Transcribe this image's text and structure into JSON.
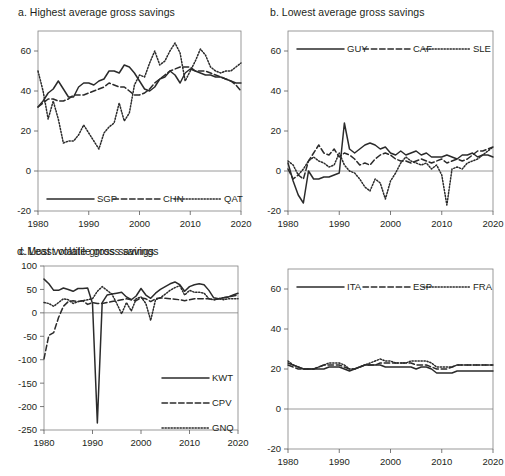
{
  "figure": {
    "background": "#ffffff",
    "line_color": "#2b2b2b",
    "axis_color": "#808080"
  },
  "panels": [
    {
      "id": "a",
      "title": "a. Highest average gross savings"
    },
    {
      "id": "b",
      "title": "b. Lowest average gross savings"
    },
    {
      "id": "c",
      "title": "c.Most volatile gross savings"
    },
    {
      "id": "d",
      "title": "d. Least volatile gross savings"
    }
  ],
  "chart_data": [
    {
      "panel": "a",
      "type": "line",
      "title": "a. Highest average gross savings",
      "xlabel": "",
      "ylabel": "",
      "xlim": [
        1980,
        2020
      ],
      "ylim": [
        -20,
        70
      ],
      "xticks": [
        1980,
        1990,
        2000,
        2010,
        2020
      ],
      "yticks": [
        -20,
        0,
        20,
        40,
        60
      ],
      "ytick_labels": [
        "-20",
        "0",
        "20",
        "40",
        "60"
      ],
      "grid": false,
      "legend_position": "bottom-inside",
      "x": [
        1980,
        1981,
        1982,
        1983,
        1984,
        1985,
        1986,
        1987,
        1988,
        1989,
        1990,
        1991,
        1992,
        1993,
        1994,
        1995,
        1996,
        1997,
        1998,
        1999,
        2000,
        2001,
        2002,
        2003,
        2004,
        2005,
        2006,
        2007,
        2008,
        2009,
        2010,
        2011,
        2012,
        2013,
        2014,
        2015,
        2016,
        2017,
        2018,
        2019,
        2020
      ],
      "series": [
        {
          "name": "SGP",
          "style": "solid",
          "values": [
            32,
            35,
            39,
            41,
            45,
            41,
            37,
            37,
            42,
            44,
            44,
            43,
            45,
            46,
            50,
            50,
            49,
            53,
            52,
            49,
            45,
            41,
            40,
            42,
            46,
            47,
            50,
            48,
            44,
            49,
            51,
            50,
            49,
            48,
            48,
            47,
            47,
            46,
            45,
            44,
            44
          ]
        },
        {
          "name": "CHN",
          "style": "dashed",
          "values": [
            32,
            34,
            36,
            36,
            35,
            35,
            36,
            38,
            38,
            38,
            39,
            40,
            41,
            42,
            44,
            43,
            42,
            42,
            40,
            38,
            38,
            39,
            41,
            44,
            46,
            48,
            50,
            51,
            52,
            52,
            52,
            50,
            50,
            50,
            49,
            48,
            47,
            46,
            45,
            43,
            40
          ]
        },
        {
          "name": "QAT",
          "style": "dotted",
          "values": [
            50,
            40,
            26,
            35,
            26,
            14,
            15,
            15,
            18,
            23,
            19,
            15,
            11,
            19,
            22,
            24,
            34,
            25,
            29,
            43,
            48,
            47,
            54,
            60,
            53,
            55,
            60,
            64,
            59,
            45,
            50,
            55,
            61,
            58,
            52,
            50,
            49,
            50,
            50,
            52,
            54
          ]
        }
      ]
    },
    {
      "panel": "b",
      "type": "line",
      "title": "b. Lowest average gross savings",
      "xlabel": "",
      "ylabel": "",
      "xlim": [
        1980,
        2020
      ],
      "ylim": [
        -20,
        70
      ],
      "xticks": [
        1980,
        1990,
        2000,
        2010,
        2020
      ],
      "yticks": [
        -20,
        0,
        20,
        40,
        60
      ],
      "ytick_labels": [
        "-20",
        "0",
        "20",
        "40",
        "60"
      ],
      "grid": false,
      "legend_position": "top-inside",
      "x": [
        1980,
        1981,
        1982,
        1983,
        1984,
        1985,
        1986,
        1987,
        1988,
        1989,
        1990,
        1991,
        1992,
        1993,
        1994,
        1995,
        1996,
        1997,
        1998,
        1999,
        2000,
        2001,
        2002,
        2003,
        2004,
        2005,
        2006,
        2007,
        2008,
        2009,
        2010,
        2011,
        2012,
        2013,
        2014,
        2015,
        2016,
        2017,
        2018,
        2019,
        2020
      ],
      "series": [
        {
          "name": "GUY",
          "style": "solid",
          "values": [
            4,
            -5,
            -12,
            -16,
            0,
            -4,
            -4,
            -3,
            -3,
            -2,
            -1,
            24,
            11,
            9,
            11,
            13,
            14,
            13,
            11,
            12,
            9,
            8,
            10,
            8,
            9,
            10,
            8,
            9,
            7,
            7,
            7,
            8,
            7,
            6,
            8,
            8,
            9,
            7,
            8,
            8,
            7
          ]
        },
        {
          "name": "CAF",
          "style": "dashed",
          "values": [
            1,
            -4,
            -2,
            -4,
            5,
            9,
            13,
            9,
            8,
            11,
            7,
            9,
            8,
            6,
            3,
            4,
            3,
            6,
            8,
            9,
            8,
            6,
            5,
            5,
            4,
            5,
            6,
            5,
            4,
            5,
            6,
            4,
            5,
            6,
            5,
            6,
            8,
            10,
            10,
            11,
            12
          ]
        },
        {
          "name": "SLE",
          "style": "dotted",
          "values": [
            5,
            3,
            -2,
            1,
            5,
            7,
            5,
            4,
            2,
            3,
            9,
            3,
            0,
            -1,
            -4,
            -8,
            -10,
            -4,
            -6,
            -14,
            -5,
            -1,
            4,
            7,
            5,
            4,
            3,
            4,
            1,
            3,
            -2,
            -17,
            1,
            2,
            1,
            4,
            5,
            6,
            8,
            10,
            12
          ]
        }
      ]
    },
    {
      "panel": "c",
      "type": "line",
      "title": "c.Most volatile gross savings",
      "xlabel": "",
      "ylabel": "",
      "xlim": [
        1980,
        2020
      ],
      "ylim": [
        -250,
        100
      ],
      "xticks": [
        1980,
        1990,
        2000,
        2010,
        2020
      ],
      "yticks": [
        -250,
        -200,
        -150,
        -100,
        -50,
        0,
        50,
        100
      ],
      "ytick_labels": [
        "-250",
        "-200",
        "-150",
        "-100",
        "-50",
        "0",
        "50",
        "100"
      ],
      "grid": false,
      "legend_position": "bottom-right-inside",
      "x": [
        1980,
        1981,
        1982,
        1983,
        1984,
        1985,
        1986,
        1987,
        1988,
        1989,
        1990,
        1991,
        1992,
        1993,
        1994,
        1995,
        1996,
        1997,
        1998,
        1999,
        2000,
        2001,
        2002,
        2003,
        2004,
        2005,
        2006,
        2007,
        2008,
        2009,
        2010,
        2011,
        2012,
        2013,
        2014,
        2015,
        2016,
        2017,
        2018,
        2019,
        2020
      ],
      "series": [
        {
          "name": "KWT",
          "style": "solid",
          "values": [
            72,
            62,
            48,
            48,
            53,
            50,
            46,
            52,
            52,
            53,
            20,
            -235,
            22,
            38,
            40,
            42,
            44,
            34,
            28,
            36,
            52,
            38,
            31,
            42,
            50,
            56,
            62,
            66,
            60,
            46,
            56,
            60,
            62,
            60,
            48,
            32,
            30,
            32,
            34,
            38,
            42
          ]
        },
        {
          "name": "CPV",
          "style": "dashed",
          "values": [
            -98,
            -48,
            -42,
            -10,
            14,
            24,
            26,
            24,
            26,
            18,
            22,
            20,
            20,
            22,
            24,
            26,
            28,
            30,
            28,
            26,
            32,
            30,
            24,
            30,
            32,
            31,
            30,
            29,
            28,
            26,
            28,
            30,
            30,
            30,
            30,
            28,
            30,
            32,
            34,
            36,
            38
          ]
        },
        {
          "name": "GNQ",
          "style": "dotted",
          "values": [
            22,
            20,
            14,
            22,
            30,
            28,
            20,
            24,
            26,
            28,
            30,
            46,
            56,
            48,
            40,
            20,
            -2,
            22,
            4,
            30,
            34,
            20,
            -16,
            28,
            32,
            40,
            48,
            54,
            58,
            38,
            48,
            44,
            44,
            42,
            30,
            28,
            30,
            28,
            30,
            30,
            30
          ]
        }
      ]
    },
    {
      "panel": "d",
      "type": "line",
      "title": "d. Least volatile gross savings",
      "xlabel": "",
      "ylabel": "",
      "xlim": [
        1980,
        2020
      ],
      "ylim": [
        -20,
        70
      ],
      "xticks": [
        1980,
        1990,
        2000,
        2010,
        2020
      ],
      "yticks": [
        -20,
        0,
        20,
        40,
        60
      ],
      "ytick_labels": [
        "-20",
        "0",
        "20",
        "40",
        "60"
      ],
      "grid": false,
      "legend_position": "top-inside",
      "x": [
        1980,
        1981,
        1982,
        1983,
        1984,
        1985,
        1986,
        1987,
        1988,
        1989,
        1990,
        1991,
        1992,
        1993,
        1994,
        1995,
        1996,
        1997,
        1998,
        1999,
        2000,
        2001,
        2002,
        2003,
        2004,
        2005,
        2006,
        2007,
        2008,
        2009,
        2010,
        2011,
        2012,
        2013,
        2014,
        2015,
        2016,
        2017,
        2018,
        2019,
        2020
      ],
      "series": [
        {
          "name": "ITA",
          "style": "solid",
          "values": [
            23,
            22,
            21,
            20,
            20,
            20,
            20,
            20,
            21,
            21,
            21,
            20,
            19,
            20,
            21,
            22,
            22,
            22,
            22,
            21,
            21,
            21,
            21,
            21,
            21,
            20,
            21,
            21,
            20,
            18,
            18,
            18,
            18,
            19,
            19,
            19,
            19,
            19,
            19,
            19,
            19
          ]
        },
        {
          "name": "ESP",
          "style": "dashed",
          "values": [
            22,
            21,
            20,
            20,
            20,
            20,
            21,
            22,
            22,
            22,
            22,
            21,
            20,
            20,
            21,
            22,
            22,
            22,
            23,
            23,
            23,
            23,
            23,
            23,
            23,
            22,
            22,
            22,
            21,
            20,
            20,
            20,
            21,
            22,
            22,
            22,
            22,
            22,
            22,
            22,
            22
          ]
        },
        {
          "name": "FRA",
          "style": "dotted",
          "values": [
            24,
            22,
            21,
            20,
            20,
            20,
            21,
            22,
            23,
            23,
            23,
            22,
            20,
            20,
            21,
            22,
            23,
            24,
            25,
            24,
            24,
            23,
            23,
            23,
            24,
            24,
            24,
            24,
            23,
            21,
            21,
            21,
            21,
            22,
            22,
            22,
            22,
            22,
            22,
            22,
            22
          ]
        }
      ]
    }
  ],
  "axis_labels": {
    "xticks": [
      "1980",
      "1990",
      "2000",
      "2010",
      "2020"
    ],
    "yticks_standard": [
      "60",
      "40",
      "20",
      "0",
      "-20"
    ],
    "yticks_panel_c": [
      "100",
      "50",
      "0",
      "-50",
      "-100",
      "-150",
      "-200",
      "-250"
    ]
  },
  "legends": {
    "a": [
      "SGP",
      "CHN",
      "QAT"
    ],
    "b": [
      "GUY",
      "CAF",
      "SLE"
    ],
    "c": [
      "KWT",
      "CPV",
      "GNQ"
    ],
    "d": [
      "ITA",
      "ESP",
      "FRA"
    ]
  }
}
